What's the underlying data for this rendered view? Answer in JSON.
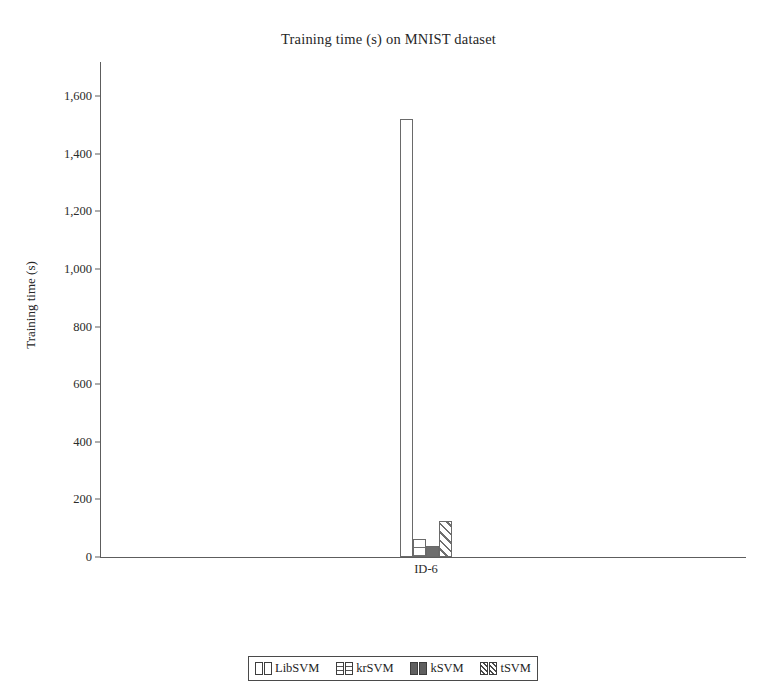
{
  "chart_data": {
    "type": "bar",
    "title": "Training time (s) on MNIST dataset",
    "xlabel": "",
    "ylabel": "Training time (s)",
    "categories": [
      "ID-6"
    ],
    "ylim": [
      0,
      1700
    ],
    "yticks": [
      0,
      200,
      400,
      600,
      800,
      1000,
      1200,
      1400,
      1600
    ],
    "ytick_labels": [
      "0",
      "200",
      "400",
      "600",
      "800",
      "1,000",
      "1,200",
      "1,400",
      "1,600"
    ],
    "grid": false,
    "legend_position": "bottom",
    "series": [
      {
        "name": "LibSVM",
        "values": [
          1520
        ],
        "pattern": "empty"
      },
      {
        "name": "krSVM",
        "values": [
          62
        ],
        "pattern": "hlines"
      },
      {
        "name": "kSVM",
        "values": [
          38
        ],
        "pattern": "solid"
      },
      {
        "name": "tSVM",
        "values": [
          125
        ],
        "pattern": "diag"
      }
    ]
  },
  "title": "Training time (s) on MNIST dataset",
  "axes": {
    "y_title": "Training time (s)",
    "y_ticks": [
      {
        "label": "1,600"
      },
      {
        "label": "1,400"
      },
      {
        "label": "1,200"
      },
      {
        "label": "1,000"
      },
      {
        "label": "800"
      },
      {
        "label": "600"
      },
      {
        "label": "400"
      },
      {
        "label": "200"
      },
      {
        "label": "0"
      }
    ],
    "x_ticks": [
      {
        "label": "ID-6"
      }
    ]
  },
  "legend": {
    "entries": [
      {
        "label": "LibSVM"
      },
      {
        "label": "krSVM"
      },
      {
        "label": "kSVM"
      },
      {
        "label": "tSVM"
      }
    ]
  },
  "colors": {
    "axis": "#5d5d5d",
    "text": "#1d1d1d",
    "bar_outline": "#6a6a6a",
    "bar_solid_fill": "#6e6e6e",
    "background": "#ffffff"
  }
}
